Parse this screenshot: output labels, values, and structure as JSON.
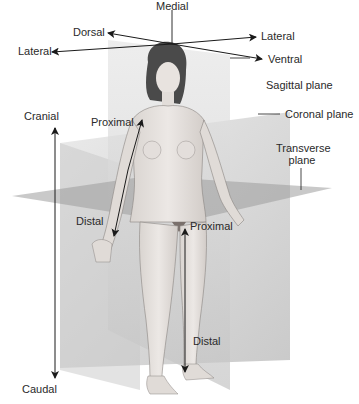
{
  "figure": {
    "direction_labels": {
      "medial": "Medial",
      "dorsal": "Dorsal",
      "lateral_left": "Lateral",
      "lateral_right": "Lateral",
      "ventral": "Ventral",
      "cranial": "Cranial",
      "caudal": "Caudal",
      "proximal_arm": "Proximal",
      "distal_arm": "Distal",
      "proximal_leg": "Proximal",
      "distal_leg": "Distal"
    },
    "plane_labels": {
      "sagittal": "Sagittal plane",
      "coronal": "Coronal plane",
      "transverse_line1": "Transverse",
      "transverse_line2": "plane"
    },
    "colors": {
      "arrow": "#1a1a1a",
      "text": "#2a2a2a",
      "sagittal_plane": "#d8d8d8",
      "coronal_plane": "#cfcfcf",
      "transverse_plane": "#9a9a9a",
      "skin": "#e6e2df",
      "hair": "#4a4a4a"
    }
  }
}
